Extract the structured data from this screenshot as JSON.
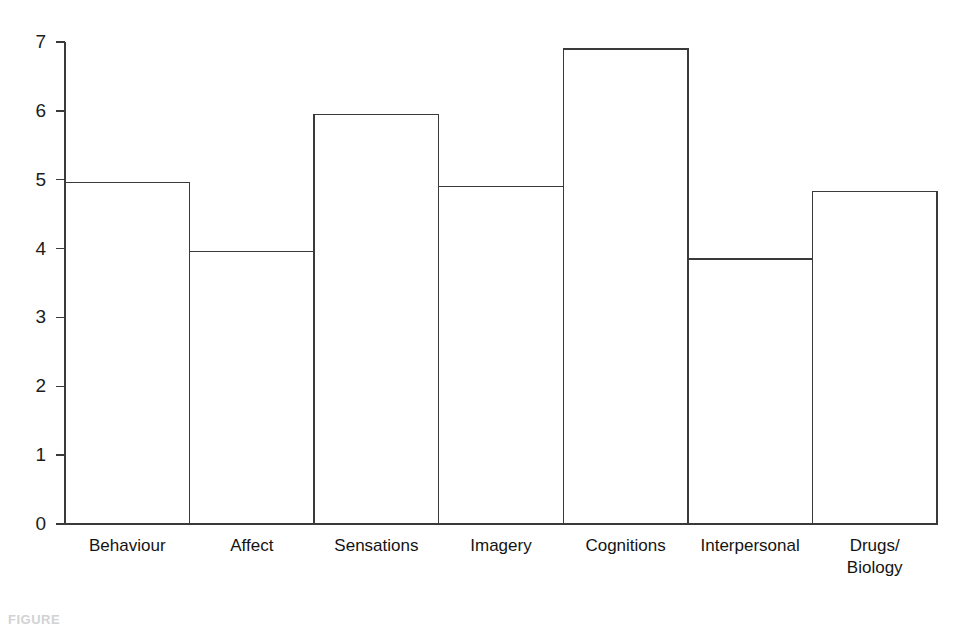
{
  "figure": {
    "caption": "FIGURE",
    "background_color": "#ffffff",
    "line_color": "#3a3a3a"
  },
  "chart_data": {
    "type": "bar",
    "title": "",
    "xlabel": "",
    "ylabel": "",
    "ylim": [
      0,
      7
    ],
    "yticks": [
      0,
      1,
      2,
      3,
      4,
      5,
      6,
      7
    ],
    "ytick_labels": [
      "0",
      "1",
      "2",
      "3",
      "4",
      "5",
      "6",
      "7"
    ],
    "grid": false,
    "legend": null,
    "bar_style": "outline-only",
    "categories": [
      "Behaviour",
      "Affect",
      "Sensations",
      "Imagery",
      "Cognitions",
      "Interpersonal",
      "Drugs/\nBiology"
    ],
    "values": [
      4.96,
      3.96,
      5.95,
      4.9,
      6.9,
      3.85,
      4.83
    ]
  }
}
